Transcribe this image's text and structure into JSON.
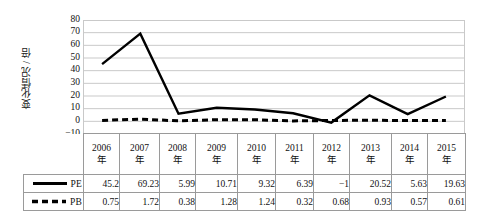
{
  "chart_data": {
    "type": "line",
    "title": "",
    "xlabel": "",
    "ylabel": "变化情况 / 倍",
    "ylim": [
      -10,
      80
    ],
    "ytick_step": 10,
    "yticks": [
      "80",
      "70",
      "60",
      "50",
      "40",
      "30",
      "20",
      "10",
      "0",
      "-10"
    ],
    "grid": true,
    "legend_position": "table-left",
    "categories": [
      "2006年",
      "2007年",
      "2008年",
      "2009年",
      "2010年",
      "2011年",
      "2012年",
      "2013年",
      "2014年",
      "2015年"
    ],
    "series": [
      {
        "name": "PE",
        "style": "solid",
        "color": "#000000",
        "values": [
          45.2,
          69.23,
          5.99,
          10.71,
          9.32,
          6.39,
          -1,
          20.52,
          5.63,
          19.63
        ]
      },
      {
        "name": "PB",
        "style": "dashed",
        "color": "#000000",
        "values": [
          0.75,
          1.72,
          0.38,
          1.28,
          1.24,
          0.32,
          0.68,
          0.93,
          0.57,
          0.61
        ]
      }
    ]
  },
  "axis": {
    "y_title": "变化情况 / 倍"
  },
  "table": {
    "header_years": [
      {
        "year": "2006",
        "suffix": "年"
      },
      {
        "year": "2007",
        "suffix": "年"
      },
      {
        "year": "2008",
        "suffix": "年"
      },
      {
        "year": "2009",
        "suffix": "年"
      },
      {
        "year": "2010",
        "suffix": "年"
      },
      {
        "year": "2011",
        "suffix": "年"
      },
      {
        "year": "2012",
        "suffix": "年"
      },
      {
        "year": "2013",
        "suffix": "年"
      },
      {
        "year": "2014",
        "suffix": "年"
      },
      {
        "year": "2015",
        "suffix": "年"
      }
    ],
    "rows": [
      {
        "label": "PE",
        "swatch": "solid-line-icon",
        "cells": [
          "45.2",
          "69.23",
          "5.99",
          "10.71",
          "9.32",
          "6.39",
          "-1",
          "20.52",
          "5.63",
          "19.63"
        ]
      },
      {
        "label": "PB",
        "swatch": "dashed-line-icon",
        "cells": [
          "0.75",
          "1.72",
          "0.38",
          "1.28",
          "1.24",
          "0.32",
          "0.68",
          "0.93",
          "0.57",
          "0.61"
        ]
      }
    ]
  },
  "colors": {
    "series_line": "#000000",
    "gridline": "#c9c9c9",
    "table_border": "#9a9a9a",
    "text": "#111111",
    "background": "#ffffff"
  }
}
